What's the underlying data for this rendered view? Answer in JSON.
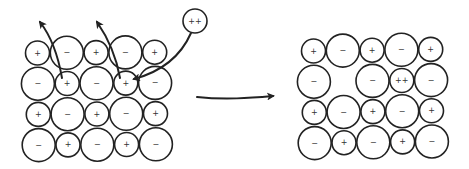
{
  "colors": {
    "stroke": "#222222",
    "background": "#ffffff",
    "label": "#333333"
  },
  "symbols": {
    "cation": "+",
    "anion": "−",
    "divalent_cation": "++"
  },
  "before": {
    "description": "Ionic lattice before substitution; two cations ejected, divalent cation entering",
    "rows": [
      [
        "+",
        "−",
        "+",
        "−",
        "+"
      ],
      [
        "−",
        "+",
        "−",
        "+",
        "−"
      ],
      [
        "+",
        "−",
        "+",
        "−",
        "+"
      ],
      [
        "−",
        "+",
        "−",
        "+",
        "−"
      ]
    ],
    "incoming_ion": "++",
    "ejection_arrows": 2,
    "insertion_arrows": 1
  },
  "transition_arrow": "process-arrow",
  "after": {
    "description": "Lattice after substitution: one cation site vacant, one replaced by divalent cation",
    "rows": [
      [
        "+",
        "−",
        "+",
        "−",
        "+"
      ],
      [
        "−",
        "",
        "−",
        "++",
        "−"
      ],
      [
        "+",
        "−",
        "+",
        "−",
        "+"
      ],
      [
        "−",
        "+",
        "−",
        "+",
        "−"
      ]
    ],
    "vacancy": {
      "row": 2,
      "col": 2
    }
  }
}
